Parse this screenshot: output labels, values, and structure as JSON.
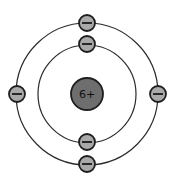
{
  "diagram": {
    "title": "",
    "type": "Bohr atomic model",
    "nucleus": {
      "label": "6+",
      "cx": 87,
      "cy": 94,
      "r": 16,
      "color": "#6e6e6e"
    },
    "orbits": [
      {
        "name": "inner-shell",
        "r": 49
      },
      {
        "name": "outer-shell",
        "r": 71
      }
    ],
    "electron_style": {
      "r": 8,
      "color": "#a9a9a9",
      "symbol": "−"
    },
    "electrons": [
      {
        "shell": "outer",
        "position": "top",
        "cx": 87,
        "cy": 23
      },
      {
        "shell": "inner",
        "position": "top",
        "cx": 87,
        "cy": 44
      },
      {
        "shell": "outer",
        "position": "left",
        "cx": 17,
        "cy": 94
      },
      {
        "shell": "outer",
        "position": "right",
        "cx": 158,
        "cy": 94
      },
      {
        "shell": "inner",
        "position": "bottom",
        "cx": 87,
        "cy": 142
      },
      {
        "shell": "outer",
        "position": "bottom",
        "cx": 87,
        "cy": 164
      }
    ]
  }
}
